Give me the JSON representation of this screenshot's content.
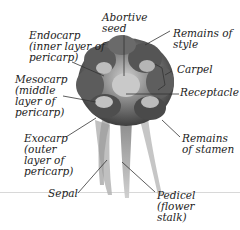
{
  "diagram": {
    "labels": {
      "endocarp": "Endocarp\n(inner layer of\npericarp)",
      "mesocarp": "Mesocarp\n(middle\nlayer of\npericarp)",
      "exocarp": "Exocarp\n(outer\nlayer of\npericarp)",
      "sepal": "Sepal",
      "abortive_seed": "Abortive\nseed",
      "remains_of_style": "Remains of\nstyle",
      "carpel": "Carpel",
      "receptacle": "Receptacle",
      "remains_of_stamen": "Remains\nof stamen",
      "pedicel": "Pedicel\n(flower\nstalk)"
    },
    "colors": {
      "specimen_dark": "#4a4a4a",
      "specimen_mid": "#8a8a8a",
      "specimen_light": "#c8c8c8",
      "leader_line": "#333333",
      "text": "#222222"
    }
  }
}
